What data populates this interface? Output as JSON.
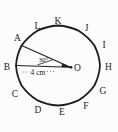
{
  "figure": {
    "vertex_labels": [
      "A",
      "B",
      "C",
      "D",
      "E",
      "F",
      "G",
      "H",
      "I",
      "J",
      "K",
      "L"
    ],
    "center_label": "O",
    "angle_label": "30°",
    "radius_label": "4 cm",
    "colors": {
      "line": "#1d1d1d",
      "background": "#fcfcfc"
    }
  }
}
